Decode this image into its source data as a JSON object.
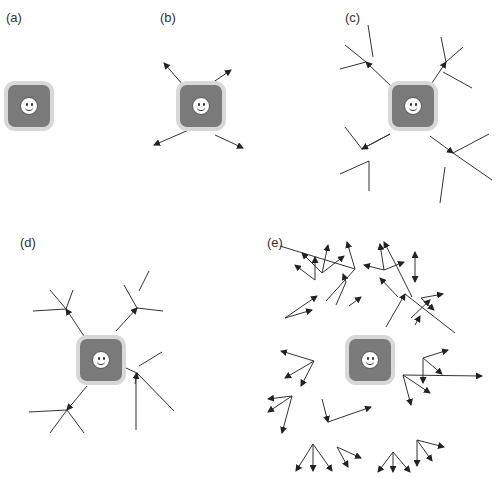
{
  "panels": [
    {
      "id": "a",
      "label": "(a)",
      "lx": 6,
      "ly": 10,
      "agent": {
        "x": 8,
        "y": 85
      }
    },
    {
      "id": "b",
      "label": "(b)",
      "lx": 160,
      "ly": 10,
      "agent": {
        "x": 180,
        "y": 85
      }
    },
    {
      "id": "c",
      "label": "(c)",
      "lx": 345,
      "ly": 10,
      "agent": {
        "x": 416,
        "y": 83
      }
    },
    {
      "id": "d",
      "label": "(d)",
      "lx": 20,
      "ly": 235,
      "agent": {
        "x": 79,
        "y": 340
      }
    },
    {
      "id": "e",
      "label": "(e)",
      "lx": 267,
      "ly": 235,
      "agent": {
        "x": 348,
        "y": 338
      }
    }
  ],
  "colors": {
    "line": "#333333",
    "agent": "#7a7a7a",
    "halo": "#d8d8d8"
  },
  "segments": {
    "arrows": [
      [
        183,
        85,
        164,
        63
      ],
      [
        209,
        85,
        231,
        70
      ],
      [
        191,
        129,
        154,
        145
      ],
      [
        215,
        135,
        243,
        148
      ],
      [
        392,
        87,
        366,
        62
      ],
      [
        430,
        86,
        446,
        62
      ],
      [
        390,
        134,
        362,
        149
      ],
      [
        430,
        136,
        453,
        153
      ],
      [
        84,
        336,
        66,
        309
      ],
      [
        116,
        331,
        137,
        308
      ],
      [
        87,
        386,
        67,
        410
      ],
      [
        135,
        384,
        137,
        373
      ],
      [
        346,
        282,
        343,
        274
      ],
      [
        398,
        297,
        380,
        278
      ],
      [
        386,
        327,
        405,
        294
      ],
      [
        411,
        318,
        430,
        300
      ],
      [
        396,
        265,
        384,
        242
      ],
      [
        355,
        269,
        347,
        242
      ],
      [
        349,
        306,
        361,
        297
      ],
      [
        415,
        325,
        420,
        316
      ]
    ],
    "lines": [
      [
        366,
        62,
        345,
        45
      ],
      [
        373,
        57,
        368,
        25
      ],
      [
        366,
        62,
        340,
        69
      ],
      [
        446,
        62,
        441,
        37
      ],
      [
        446,
        62,
        463,
        47
      ],
      [
        443,
        72,
        472,
        88
      ],
      [
        362,
        149,
        345,
        127
      ],
      [
        362,
        149,
        390,
        134
      ],
      [
        369,
        161,
        340,
        174
      ],
      [
        369,
        161,
        369,
        191
      ],
      [
        453,
        153,
        489,
        134
      ],
      [
        453,
        153,
        492,
        180
      ],
      [
        445,
        167,
        440,
        203
      ],
      [
        66,
        309,
        50,
        290
      ],
      [
        66,
        309,
        73,
        290
      ],
      [
        66,
        309,
        33,
        311
      ],
      [
        137,
        308,
        124,
        285
      ],
      [
        139,
        291,
        149,
        271
      ],
      [
        137,
        308,
        163,
        311
      ],
      [
        67,
        410,
        29,
        412
      ],
      [
        67,
        410,
        50,
        433
      ],
      [
        67,
        410,
        84,
        433
      ],
      [
        137,
        373,
        117,
        364
      ],
      [
        137,
        373,
        174,
        411
      ],
      [
        136,
        373,
        136,
        430
      ],
      [
        139,
        366,
        162,
        352
      ],
      [
        346,
        282,
        336,
        305
      ],
      [
        396,
        265,
        412,
        297
      ],
      [
        355,
        269,
        326,
        301
      ],
      [
        355,
        269,
        280,
        246
      ],
      [
        405,
        294,
        455,
        333
      ]
    ]
  },
  "cluster_arrows_e": [
    [
      322,
      273,
      302,
      253
    ],
    [
      322,
      273,
      344,
      256
    ],
    [
      322,
      273,
      328,
      245
    ],
    [
      315,
      280,
      295,
      265
    ],
    [
      315,
      280,
      315,
      257
    ],
    [
      384,
      270,
      364,
      265
    ],
    [
      384,
      270,
      380,
      244
    ],
    [
      384,
      270,
      404,
      262
    ],
    [
      415,
      266,
      415,
      252
    ],
    [
      415,
      266,
      415,
      282
    ],
    [
      421,
      298,
      443,
      294
    ],
    [
      421,
      298,
      434,
      310
    ],
    [
      285,
      318,
      312,
      310
    ],
    [
      285,
      318,
      317,
      296
    ],
    [
      403,
      375,
      482,
      376
    ],
    [
      403,
      375,
      411,
      405
    ],
    [
      403,
      375,
      430,
      393
    ],
    [
      314,
      361,
      281,
      351
    ],
    [
      314,
      361,
      285,
      378
    ],
    [
      314,
      361,
      301,
      386
    ],
    [
      423,
      358,
      448,
      350
    ],
    [
      423,
      358,
      442,
      374
    ],
    [
      423,
      358,
      423,
      383
    ],
    [
      292,
      396,
      268,
      399
    ],
    [
      292,
      396,
      268,
      412
    ],
    [
      292,
      396,
      282,
      433
    ],
    [
      322,
      399,
      328,
      422
    ],
    [
      328,
      422,
      371,
      407
    ],
    [
      313,
      444,
      296,
      471
    ],
    [
      313,
      444,
      313,
      471
    ],
    [
      313,
      444,
      332,
      471
    ],
    [
      337,
      447,
      348,
      467
    ],
    [
      337,
      447,
      361,
      458
    ],
    [
      393,
      452,
      378,
      472
    ],
    [
      393,
      452,
      393,
      472
    ],
    [
      393,
      452,
      410,
      472
    ],
    [
      417,
      440,
      444,
      447
    ],
    [
      417,
      440,
      432,
      461
    ],
    [
      417,
      440,
      417,
      466
    ]
  ]
}
